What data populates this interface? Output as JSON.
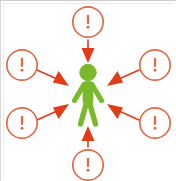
{
  "illustration": {
    "title": "Person surrounded by warning alerts",
    "background_color": "#ffffff",
    "frame_color": "#d8d8d8",
    "alert_color": "#e8512a",
    "alert_stroke_color": "#e06a45",
    "arrow_color": "#e23b17",
    "figure_color": "#7ab92a",
    "figure": {
      "name": "green-stick-figure",
      "center_x": 88,
      "center_y": 95,
      "color": "#7ab92a"
    },
    "alerts": [
      {
        "id": "alert-top",
        "label": "!",
        "cx": 88,
        "cy": 22,
        "r": 16
      },
      {
        "id": "alert-upper-left",
        "label": "!",
        "cx": 22,
        "cy": 65,
        "r": 16
      },
      {
        "id": "alert-lower-left",
        "label": "!",
        "cx": 22,
        "cy": 123,
        "r": 16
      },
      {
        "id": "alert-upper-right",
        "label": "!",
        "cx": 155,
        "cy": 65,
        "r": 16
      },
      {
        "id": "alert-lower-right",
        "label": "!",
        "cx": 155,
        "cy": 123,
        "r": 16
      },
      {
        "id": "alert-bottom",
        "label": "!",
        "cx": 88,
        "cy": 165,
        "r": 16
      }
    ],
    "arrows": [
      {
        "id": "arrow-from-top",
        "from": "alert-top",
        "to": "figure",
        "x1": 88,
        "y1": 42,
        "x2": 88,
        "y2": 62
      },
      {
        "id": "arrow-from-upper-left",
        "from": "alert-upper-left",
        "to": "figure",
        "x1": 38,
        "y1": 70,
        "x2": 68,
        "y2": 85
      },
      {
        "id": "arrow-from-lower-left",
        "from": "alert-lower-left",
        "to": "figure",
        "x1": 38,
        "y1": 119,
        "x2": 68,
        "y2": 100
      },
      {
        "id": "arrow-from-upper-right",
        "from": "alert-upper-right",
        "to": "figure",
        "x1": 139,
        "y1": 70,
        "x2": 110,
        "y2": 85
      },
      {
        "id": "arrow-from-lower-right",
        "from": "alert-lower-right",
        "to": "figure",
        "x1": 139,
        "y1": 119,
        "x2": 110,
        "y2": 100
      },
      {
        "id": "arrow-from-bottom",
        "from": "alert-bottom",
        "to": "figure",
        "x1": 88,
        "y1": 147,
        "x2": 88,
        "y2": 128
      }
    ]
  }
}
